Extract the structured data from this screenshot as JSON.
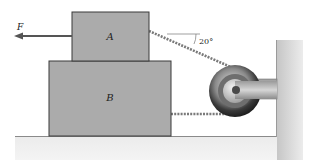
{
  "diagram": {
    "labels": {
      "force": "F",
      "block_a": "A",
      "block_b": "B",
      "angle": "20°"
    },
    "colors": {
      "block_fill": "#a9a9a9",
      "block_stroke": "#3a3a3a",
      "floor_top": "#cfcfcf",
      "floor_bottom": "#f2f2f2",
      "rope": "#8a8a8a",
      "pulley_dark": "#2b2b2b",
      "pulley_light": "#d8d8d8",
      "arrow": "#555555"
    }
  }
}
